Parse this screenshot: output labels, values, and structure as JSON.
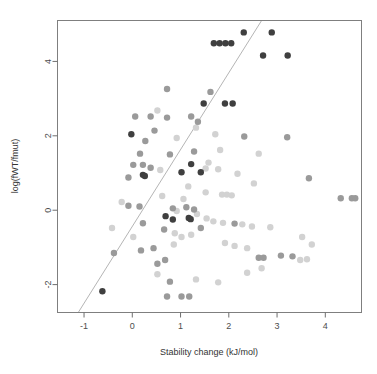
{
  "chart_data": {
    "type": "scatter",
    "title": "",
    "xlabel": "Stability change (kJ/mol)",
    "ylabel": "log(fWT/fmut)",
    "xlim": [
      -1.55,
      4.75
    ],
    "ylim": [
      -2.75,
      5.1
    ],
    "xticks": [
      -1,
      0,
      1,
      2,
      3,
      4
    ],
    "xticklabels": [
      "-1",
      "0",
      "1",
      "2",
      "3",
      "4"
    ],
    "yticks": [
      -2,
      0,
      2,
      4
    ],
    "yticklabels": [
      "-2",
      "0",
      "2",
      "4"
    ],
    "grid": false,
    "legend": null,
    "point_radius": 3.2,
    "colors": {
      "highlight": "#3f3f3f",
      "mid": "#9a9a9a",
      "faint": "#d2d2d2",
      "veryfaint": "#e6e6e6",
      "regression_line": "#b5b5b5",
      "frame": "#7f7f7f",
      "text": "#333333"
    },
    "regression": {
      "x_start": -1.12,
      "y_start": -2.75,
      "x_end": 2.68,
      "y_end": 5.1
    },
    "series": [
      {
        "name": "highlighted",
        "color": "#3f3f3f",
        "points": [
          [
            2.31,
            4.78
          ],
          [
            2.89,
            4.78
          ],
          [
            1.69,
            4.49
          ],
          [
            1.81,
            4.49
          ],
          [
            1.93,
            4.49
          ],
          [
            2.05,
            4.49
          ],
          [
            2.71,
            4.16
          ],
          [
            3.22,
            4.16
          ],
          [
            1.48,
            2.87
          ],
          [
            1.92,
            2.87
          ],
          [
            2.08,
            2.87
          ],
          [
            -0.02,
            2.04
          ],
          [
            1.22,
            1.24
          ],
          [
            1.02,
            1.02
          ],
          [
            1.42,
            1.02
          ],
          [
            0.22,
            0.95
          ],
          [
            0.26,
            0.92
          ],
          [
            0.69,
            -0.16
          ],
          [
            0.84,
            -0.25
          ],
          [
            1.17,
            -0.21
          ],
          [
            1.21,
            -0.24
          ],
          [
            -0.62,
            -2.18
          ]
        ]
      },
      {
        "name": "mid-gray",
        "color": "#9a9a9a",
        "points": [
          [
            0.06,
            2.52
          ],
          [
            0.38,
            2.52
          ],
          [
            0.72,
            2.49
          ],
          [
            1.22,
            2.52
          ],
          [
            1.36,
            2.38
          ],
          [
            0.72,
            3.26
          ],
          [
            1.62,
            3.18
          ],
          [
            0.46,
            2.14
          ],
          [
            0.27,
            1.86
          ],
          [
            0.16,
            1.52
          ],
          [
            0.78,
            1.5
          ],
          [
            0.02,
            1.22
          ],
          [
            0.22,
            1.22
          ],
          [
            0.38,
            1.14
          ],
          [
            -0.08,
            0.88
          ],
          [
            1.28,
            1.58
          ],
          [
            3.21,
            1.96
          ],
          [
            2.32,
            1.98
          ],
          [
            -0.08,
            0.12
          ],
          [
            0.15,
            0.1
          ],
          [
            0.84,
            0.05
          ],
          [
            1.12,
            0.08
          ],
          [
            1.28,
            0.02
          ],
          [
            3.66,
            0.86
          ],
          [
            4.32,
            0.32
          ],
          [
            4.55,
            0.32
          ],
          [
            4.62,
            0.32
          ],
          [
            0.22,
            -0.35
          ],
          [
            0.66,
            -0.52
          ],
          [
            1.42,
            -0.48
          ],
          [
            2.12,
            -0.36
          ],
          [
            0.18,
            -1.08
          ],
          [
            0.44,
            -1.02
          ],
          [
            0.52,
            -1.44
          ],
          [
            0.68,
            -1.34
          ],
          [
            -0.38,
            -1.15
          ],
          [
            2.62,
            -1.28
          ],
          [
            2.72,
            -1.28
          ],
          [
            3.08,
            -1.22
          ],
          [
            3.32,
            -1.24
          ],
          [
            0.72,
            -2.32
          ],
          [
            1.02,
            -2.32
          ],
          [
            1.18,
            -2.32
          ],
          [
            0.78,
            -1.92
          ]
        ]
      },
      {
        "name": "faint-gray",
        "color": "#d2d2d2",
        "points": [
          [
            0.52,
            2.68
          ],
          [
            1.32,
            2.22
          ],
          [
            0.92,
            1.94
          ],
          [
            1.82,
            1.62
          ],
          [
            1.58,
            1.28
          ],
          [
            0.58,
            1.08
          ],
          [
            1.16,
            0.64
          ],
          [
            1.52,
            0.48
          ],
          [
            1.86,
            0.42
          ],
          [
            1.96,
            0.42
          ],
          [
            2.06,
            0.4
          ],
          [
            0.62,
            0.38
          ],
          [
            1.06,
            0.3
          ],
          [
            -0.22,
            0.22
          ],
          [
            0.92,
            -0.02
          ],
          [
            1.34,
            -0.1
          ],
          [
            1.54,
            -0.22
          ],
          [
            1.68,
            -0.3
          ],
          [
            1.88,
            -0.34
          ],
          [
            2.28,
            -0.38
          ],
          [
            2.48,
            -0.44
          ],
          [
            2.86,
            -0.46
          ],
          [
            0.88,
            -0.62
          ],
          [
            1.02,
            -0.72
          ],
          [
            1.22,
            -0.66
          ],
          [
            0.86,
            -0.92
          ],
          [
            1.92,
            -0.88
          ],
          [
            2.12,
            -0.96
          ],
          [
            2.38,
            -1.02
          ],
          [
            3.52,
            -0.72
          ],
          [
            3.72,
            -0.92
          ],
          [
            3.48,
            -1.34
          ],
          [
            3.62,
            -1.32
          ],
          [
            2.38,
            -1.68
          ],
          [
            0.52,
            -1.72
          ],
          [
            1.32,
            -1.86
          ],
          [
            1.78,
            -1.94
          ],
          [
            2.68,
            -1.56
          ],
          [
            -0.42,
            -0.48
          ],
          [
            0.02,
            -0.72
          ],
          [
            1.52,
            1.12
          ],
          [
            1.78,
            1.1
          ],
          [
            2.18,
            0.98
          ],
          [
            2.52,
            0.72
          ],
          [
            1.72,
            2.04
          ],
          [
            2.62,
            1.52
          ]
        ]
      }
    ]
  },
  "axis": {
    "x_title": "Stability change (kJ/mol)",
    "y_title": "log(fWT/fmut)"
  }
}
